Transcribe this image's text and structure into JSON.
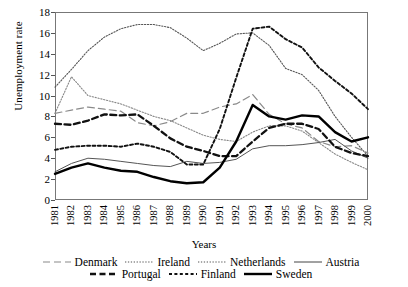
{
  "chart_data": {
    "type": "line",
    "title": "",
    "xlabel": "Years",
    "ylabel": "Unemployment rate",
    "xlim": [
      1981,
      2000
    ],
    "ylim": [
      0,
      18
    ],
    "ytick_step": 2,
    "grid": false,
    "legend_position": "bottom",
    "categories": [
      "1981",
      "1982",
      "1983",
      "1984",
      "1985",
      "1986",
      "1987",
      "1988",
      "1989",
      "1990",
      "1991",
      "1992",
      "1993",
      "1994",
      "1995",
      "1996",
      "1997",
      "1998",
      "1999",
      "2000"
    ],
    "yticks": [
      "0",
      "2",
      "4",
      "6",
      "8",
      "10",
      "12",
      "14",
      "16",
      "18"
    ],
    "series": [
      {
        "name": "Denmark",
        "style": "long-dash",
        "color": "#8a8a8a",
        "values": [
          8.3,
          8.6,
          8.9,
          8.7,
          8.5,
          7.4,
          7.1,
          7.5,
          8.3,
          8.3,
          8.9,
          9.2,
          10.1,
          8.2,
          7.3,
          6.9,
          5.6,
          5.1,
          5.2,
          4.5
        ]
      },
      {
        "name": "Ireland",
        "style": "fine-dot",
        "color": "#555555",
        "values": [
          10.8,
          12.5,
          14.3,
          15.6,
          16.4,
          16.8,
          16.8,
          16.5,
          15.5,
          14.3,
          15.0,
          15.9,
          16.0,
          14.8,
          12.6,
          12.0,
          10.5,
          8.0,
          6.0,
          4.2
        ]
      },
      {
        "name": "Netherlands",
        "style": "fine-dot",
        "color": "#888888",
        "values": [
          8.3,
          11.8,
          10.0,
          9.6,
          9.2,
          8.6,
          8.0,
          7.6,
          6.9,
          6.2,
          5.8,
          5.6,
          6.5,
          7.1,
          7.1,
          6.6,
          5.5,
          4.4,
          3.6,
          2.9
        ]
      },
      {
        "name": "Austria",
        "style": "thin-solid",
        "color": "#555555",
        "values": [
          2.7,
          3.5,
          4.0,
          3.9,
          3.7,
          3.5,
          3.3,
          3.2,
          3.7,
          3.5,
          3.6,
          3.9,
          4.9,
          5.2,
          5.2,
          5.3,
          5.5,
          5.8,
          4.7,
          4.0
        ]
      },
      {
        "name": "Portugal",
        "style": "bold-dash",
        "color": "#111111",
        "values": [
          7.3,
          7.2,
          7.6,
          8.2,
          8.1,
          8.2,
          7.1,
          5.9,
          5.1,
          4.7,
          4.2,
          4.2,
          5.6,
          6.9,
          7.3,
          7.3,
          6.8,
          5.1,
          4.5,
          4.2
        ]
      },
      {
        "name": "Finland",
        "style": "med-dash",
        "color": "#111111",
        "values": [
          4.8,
          5.1,
          5.2,
          5.2,
          5.1,
          5.4,
          5.1,
          4.6,
          3.4,
          3.4,
          6.8,
          11.7,
          16.4,
          16.6,
          15.4,
          14.6,
          12.7,
          11.4,
          10.2,
          8.7
        ]
      },
      {
        "name": "Sweden",
        "style": "bold-solid",
        "color": "#000000",
        "values": [
          2.5,
          3.1,
          3.5,
          3.1,
          2.8,
          2.7,
          2.2,
          1.8,
          1.6,
          1.7,
          3.1,
          5.6,
          9.1,
          8.0,
          7.7,
          8.1,
          8.0,
          6.5,
          5.6,
          6.0
        ]
      }
    ]
  },
  "legend": {
    "row1": [
      {
        "label": "Denmark",
        "style": "long-dash"
      },
      {
        "label": "Ireland",
        "style": "fine-dot"
      },
      {
        "label": "Netherlands",
        "style": "fine-dot"
      },
      {
        "label": "Austria",
        "style": "thin-solid"
      }
    ],
    "row2": [
      {
        "label": "Portugal",
        "style": "bold-dash"
      },
      {
        "label": "Finland",
        "style": "med-dash"
      },
      {
        "label": "Sweden",
        "style": "bold-solid"
      }
    ]
  }
}
